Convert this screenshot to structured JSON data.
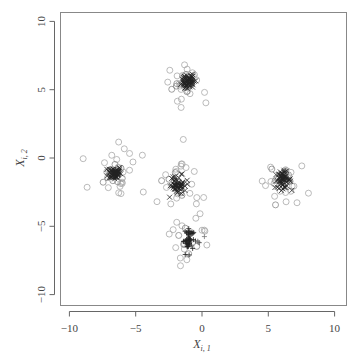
{
  "chart_data": {
    "type": "scatter",
    "title": "",
    "xlabel": "X_{i,1}",
    "ylabel": "X_{i,2}",
    "xlabel_main": "X",
    "xlabel_sub": "i, 1",
    "ylabel_main": "X",
    "ylabel_sub": "i, 2",
    "xlim": [
      -10.5,
      10.7
    ],
    "ylim": [
      -10.8,
      10.7
    ],
    "xticks": [
      -10,
      -5,
      0,
      5,
      10
    ],
    "yticks": [
      -10,
      -5,
      0,
      5,
      10
    ],
    "xtick_labels": [
      "−10",
      "−5",
      "0",
      "5",
      "10"
    ],
    "ytick_labels": [
      "−10",
      "−5",
      "0",
      "5",
      "10"
    ],
    "grid": false,
    "legend": null,
    "marker_color": "#555555",
    "core_color": "#222222",
    "clusters": [
      {
        "name": "cluster-top",
        "center": [
          -1.1,
          5.6
        ],
        "core_marker": "x",
        "core_count": 60,
        "core_sd": 0.25,
        "outlier_count": 22,
        "outlier_sd": 1.0
      },
      {
        "name": "cluster-left",
        "center": [
          -6.6,
          -1.1
        ],
        "core_marker": "x",
        "core_count": 60,
        "core_sd": 0.25,
        "outlier_count": 22,
        "outlier_sd": 1.0
      },
      {
        "name": "cluster-middle",
        "center": [
          -1.8,
          -2.0
        ],
        "core_marker": "x",
        "core_count": 55,
        "core_sd": 0.3,
        "outlier_count": 22,
        "outlier_sd": 1.1
      },
      {
        "name": "cluster-right",
        "center": [
          6.1,
          -1.6
        ],
        "core_marker": "x",
        "core_count": 60,
        "core_sd": 0.3,
        "outlier_count": 18,
        "outlier_sd": 1.0
      },
      {
        "name": "cluster-bottom",
        "center": [
          -1.0,
          -6.0
        ],
        "core_marker": "+",
        "core_count": 45,
        "core_sd": 0.4,
        "outlier_count": 14,
        "outlier_sd": 0.9
      }
    ],
    "outlier_marker": "o"
  },
  "layout": {
    "plot_left": 60.5,
    "plot_top": 12.5,
    "plot_right": 346.5,
    "plot_bottom": 305.5,
    "x_zero_px": 202,
    "x_px_per_unit": 13.26,
    "y_zero_px": 158,
    "y_px_per_unit": 13.66
  }
}
